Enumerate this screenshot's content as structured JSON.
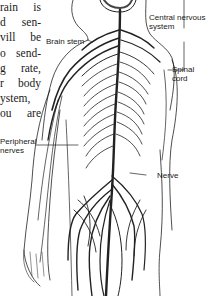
{
  "document": {
    "body_text_lines": [
      "rain is",
      "d sen-",
      "vill be",
      "o send-",
      "g rate,",
      "r body",
      "ystem,",
      "ou are"
    ]
  },
  "figure": {
    "labels": {
      "brain_stem": "Brain stem",
      "central_nervous_system_line1": "Central nervous",
      "central_nervous_system_line2": "system",
      "spinal_cord_line1": "Spinal",
      "spinal_cord_line2": "cord",
      "peripheral_nerves_line1": "Peripheral",
      "peripheral_nerves_line2": "nerves",
      "nerve": "Nerve"
    }
  }
}
